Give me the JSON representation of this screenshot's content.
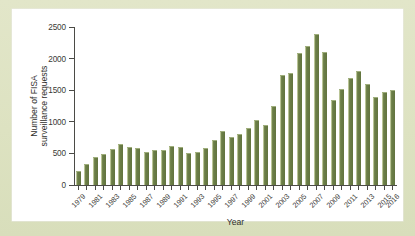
{
  "figure": {
    "panel_background": "#ffffff",
    "mat_background": "#dde2c1",
    "bar_color": "#6d8049",
    "axis_color": "#4b4b46"
  },
  "chart_data": {
    "type": "bar",
    "title": "",
    "xlabel": "Year",
    "ylabel_line1": "Number of FISA",
    "ylabel_line2": "surveillance requests",
    "ylabel": "Number of FISA surveillance requests",
    "ylim": [
      0,
      2500
    ],
    "yticks": [
      0,
      500,
      1000,
      1500,
      2000,
      2500
    ],
    "ytick_labels": [
      "0",
      "500",
      "1000",
      "1500",
      "2000",
      "2500"
    ],
    "grid": false,
    "legend": false,
    "categories": [
      "1979",
      "1980",
      "1981",
      "1982",
      "1983",
      "1984",
      "1985",
      "1986",
      "1987",
      "1988",
      "1989",
      "1990",
      "1991",
      "1992",
      "1993",
      "1994",
      "1995",
      "1996",
      "1997",
      "1998",
      "1999",
      "2000",
      "2001",
      "2002",
      "2003",
      "2004",
      "2005",
      "2006",
      "2007",
      "2008",
      "2009",
      "2010",
      "2011",
      "2012",
      "2013",
      "2014",
      "2015",
      "2016"
    ],
    "values": [
      199,
      319,
      431,
      473,
      549,
      635,
      587,
      573,
      512,
      534,
      546,
      595,
      593,
      484,
      509,
      576,
      697,
      839,
      749,
      796,
      880,
      1005,
      932,
      1228,
      1727,
      1758,
      2072,
      2176,
      2370,
      2083,
      1329,
      1511,
      1676,
      1789,
      1588,
      1379,
      1457,
      1485
    ],
    "xtick_labels": [
      "1979",
      "1981",
      "1983",
      "1985",
      "1987",
      "1989",
      "1991",
      "1993",
      "1995",
      "1997",
      "1999",
      "2001",
      "2003",
      "2005",
      "2007",
      "2009",
      "2011",
      "2013",
      "2015",
      "2016"
    ]
  }
}
